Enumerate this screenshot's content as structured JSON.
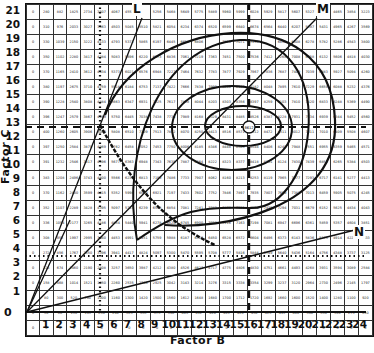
{
  "chart_data": {
    "type": "table",
    "title": "",
    "xlabel": "Factor B",
    "ylabel": "Factor C",
    "x_ticks": [
      "1",
      "2",
      "3",
      "4",
      "5",
      "6",
      "7",
      "8",
      "9",
      "10",
      "11",
      "12",
      "13",
      "14",
      "15",
      "16",
      "17",
      "18",
      "19",
      "20",
      "21",
      "22",
      "23",
      "24"
    ],
    "y_ticks": [
      "21",
      "20",
      "19",
      "18",
      "17",
      "16",
      "15",
      "14",
      "13",
      "12",
      "11",
      "10",
      "9",
      "8",
      "7",
      "6",
      "5",
      "4",
      "3",
      "2",
      "1"
    ],
    "origin_label": "0",
    "grid_columns": "Factor B = 0..24",
    "grid_rows": "Factor C = 21..0",
    "rows": [
      [
        "0",
        "280",
        "882",
        "1825",
        "2734",
        "3507",
        "4067",
        "4557",
        "",
        "5256",
        "5468",
        "5649",
        "5775",
        "5889",
        "5960",
        "5999",
        "6028",
        "5929",
        "5817",
        "5607",
        "5327",
        "",
        "4465",
        "3854",
        "3223"
      ],
      [
        "0",
        "310",
        "976",
        "2033",
        "3027",
        "3863",
        "4503",
        "5045",
        "5510",
        "5821",
        "6054",
        "6234",
        "6374",
        "6520",
        "6599",
        "6640",
        "6674",
        "6564",
        "6440",
        "6207",
        "5897",
        "5431",
        "4965",
        "4267",
        "3569"
      ],
      [
        "0",
        "330",
        "1039",
        "2150",
        "3222",
        "4133",
        "4793",
        "5371",
        "5865",
        "6197",
        "6445",
        "6658",
        "6806",
        "",
        "7025",
        "7071",
        "7135",
        "",
        "6856",
        "6608",
        "6278",
        "5782",
        "5286",
        "4543",
        "3800"
      ],
      [
        "0",
        "350",
        "1102",
        "2280",
        "3417",
        "4384",
        "5083",
        "5696",
        "6220",
        "6573",
        "6836",
        "7061",
        "7219",
        "7363",
        "7451",
        "7500",
        "7536",
        "7412",
        "7268",
        "7008",
        "6658",
        "6132",
        "5606",
        "4818",
        "4030"
      ],
      [
        "0",
        "370",
        "1165",
        "2410",
        "3612",
        "4634",
        "5373",
        "6021",
        "6576",
        "6948",
        "7227",
        "7464",
        "7632",
        "7783",
        "7877",
        "7929",
        "7967",
        "7836",
        "7687",
        "7409",
        "7039",
        "6483",
        "5927",
        "5094",
        "4260"
      ],
      [
        "0",
        "380",
        "1197",
        "2675",
        "3710",
        "4759",
        "5518",
        "6184",
        "6753",
        "7137",
        "7422",
        "7666",
        "7838",
        "7993",
        "8090",
        "8142",
        "8182",
        "8048",
        "7895",
        "7610",
        "7229",
        "6659",
        "6088",
        "5232",
        "4376"
      ],
      [
        "0",
        "390",
        "1228",
        "2540",
        "3808",
        "4884",
        "5663",
        "6347",
        "6931",
        "7325",
        "7617",
        "7868",
        "8044",
        "8203",
        "8303",
        "8356",
        "8397",
        "8259",
        "8103",
        "7810",
        "7420",
        "6833",
        "6248",
        "5369",
        "4490"
      ],
      [
        "0",
        "396",
        "1247",
        "2579",
        "3867",
        "4959",
        "5750",
        "6445",
        "7038",
        "7438",
        "7734",
        "7989",
        "8168",
        "8329",
        "8431",
        "8485",
        "8526",
        "8387",
        "8228",
        "7931",
        "7534",
        "6939",
        "6344",
        "5452",
        "4560"
      ],
      [
        "0",
        "400",
        "1260",
        "2605",
        "3906",
        "5009",
        "5808",
        "6510",
        "7109",
        "7513",
        "7812",
        "8070",
        "8250",
        "8413",
        "8516",
        "8571",
        "8612",
        "8472",
        "8311",
        "8012",
        "7611",
        "7010",
        "6409",
        "5508",
        "4607"
      ],
      [
        "0",
        "397",
        "1250",
        "2584",
        "3875",
        "4969",
        "5762",
        "6458",
        "7052",
        "7453",
        "7750",
        "8006",
        "8185",
        "8346",
        "8448",
        "8503",
        "8544",
        "8406",
        "8245",
        "7948",
        "7551",
        "6955",
        "6359",
        "5465",
        "4571"
      ],
      [
        "0",
        "391",
        "1232",
        "2546",
        "3817",
        "4896",
        "5677",
        "6363",
        "6948",
        "7343",
        "7635",
        "7887",
        "8064",
        "8222",
        "8323",
        "8377",
        "8418",
        "8281",
        "8124",
        "7830",
        "7439",
        "6852",
        "6265",
        "5384",
        "4503"
      ],
      [
        "0",
        "383",
        "1208",
        "2496",
        "3743",
        "4800",
        "5566",
        "6238",
        "6813",
        "7199",
        "7486",
        "7733",
        "7907",
        "8062",
        "8160",
        "8213",
        "8253",
        "8119",
        "7965",
        "7677",
        "7293",
        "6717",
        "6141",
        "5277",
        "4413"
      ],
      [
        "0",
        "370",
        "1162",
        "2400",
        "3599",
        "4615",
        "5352",
        "5998",
        "6550",
        "6921",
        "7197",
        "7433",
        "7602",
        "7752",
        "7846",
        "7897",
        "7935",
        "7807",
        "7659",
        "7382",
        "7013",
        "6459",
        "5905",
        "5075",
        "4245"
      ],
      [
        "0",
        "352",
        "1107",
        "2289",
        "3428",
        "4395",
        "5097",
        "5713",
        "6239",
        "6592",
        "6854",
        "7081",
        "7241",
        "7383",
        "7472",
        "7521",
        "7558",
        "7435",
        "7294",
        "7031",
        "6679",
        "6152",
        "5625",
        "4834",
        "4043"
      ],
      [
        "0",
        "336",
        "1054",
        "2177",
        "3265",
        "4186",
        "4854",
        "5440",
        "5941",
        "6278",
        "6528",
        "6745",
        "6900",
        "7030",
        "7116",
        "7163",
        "7198",
        "7081",
        "6947",
        "6696",
        "6361",
        "5859",
        "5357",
        "4604",
        "3851"
      ],
      [
        "0",
        "308",
        "953",
        "1997",
        "2995",
        "3840",
        "4453",
        "4991",
        "5451",
        "5759",
        "5988",
        "6187",
        "6329",
        "6450",
        "6528",
        "6572",
        "6604",
        "6496",
        "6373",
        "6143",
        "5836",
        "5375",
        "4914",
        "4223",
        "3533"
      ],
      [
        "0",
        "272",
        "856",
        "1767",
        "2650",
        "3396",
        "3941",
        "4417",
        "4824",
        "5097",
        "5300",
        "5470",
        "5595",
        "5708",
        "5777",
        "5816",
        "5844",
        "5749",
        "5640",
        "5436",
        "5164",
        "4756",
        "4348",
        "3737",
        "3125"
      ],
      [
        "0",
        "224",
        "674",
        "1460",
        "2190",
        "2808",
        "3257",
        "3650",
        "3987",
        "4212",
        "4380",
        "4526",
        "4627",
        "4717",
        "4775",
        "4806",
        "4830",
        "4751",
        "4661",
        "4493",
        "4268",
        "3931",
        "3594",
        "3089",
        "2584"
      ],
      [
        "0",
        "158",
        "468",
        "1014",
        "1521",
        "1950",
        "2260",
        "2535",
        "2766",
        "2925",
        "3042",
        "3143",
        "3214",
        "3276",
        "3315",
        "3338",
        "3354",
        "3299",
        "3237",
        "3120",
        "2964",
        "2730",
        "2496",
        "2145",
        "1797"
      ],
      [
        "0",
        "80",
        "300",
        "520",
        "780",
        "1000",
        "1160",
        "1300",
        "1420",
        "1500",
        "1560",
        "1612",
        "1648",
        "1680",
        "1700",
        "1712",
        "1720",
        "1692",
        "1660",
        "1600",
        "1520",
        "1400",
        "1280",
        "1100",
        "920"
      ],
      [
        "0",
        "30",
        "60",
        "130",
        "195",
        "250",
        "290",
        "325",
        "355",
        "375",
        "390",
        "403",
        "412",
        "420",
        "425",
        "428",
        "430",
        "423",
        "415",
        "400",
        "380",
        "350",
        "320",
        "275",
        "230"
      ],
      [
        "0",
        "0",
        "0",
        "0",
        "0",
        "0",
        "0",
        "0",
        "0",
        "0",
        "0",
        "0",
        "0",
        "0",
        "0",
        "0",
        "0",
        "0",
        "0",
        "0",
        "0",
        "0",
        "0",
        "0",
        "0"
      ]
    ],
    "annotations": [
      {
        "label": "L",
        "position": "top, near column B=8, row C=21"
      },
      {
        "label": "M",
        "position": "top right, near column B=21, row C=21"
      },
      {
        "label": "N",
        "position": "right, near column B=24, row C=6"
      },
      {
        "label": "8612",
        "position": "circled maximum at B=16, C=13"
      }
    ],
    "reference_lines": [
      {
        "style": "dashed horizontal",
        "at": "C=13"
      },
      {
        "style": "dashed vertical",
        "at": "B=16"
      },
      {
        "style": "dotted vertical",
        "at": "B=5"
      },
      {
        "style": "dotted horizontal",
        "at": "between C=3 and C=4"
      }
    ],
    "contours": "closed elliptical iso-response curves centered on the maximum at B=16, C=13",
    "grid": true
  },
  "axes": {
    "x_title": "Factor B",
    "y_title": "Factor C",
    "origin": "0"
  },
  "markers": {
    "L": "L",
    "M": "M",
    "N": "N"
  }
}
